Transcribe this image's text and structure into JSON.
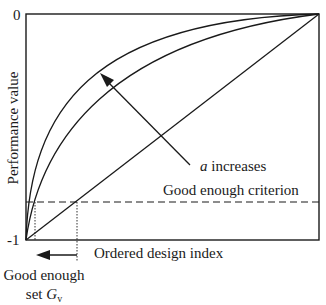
{
  "figure": {
    "y_axis": {
      "label": "Performance value",
      "tick_top": "0",
      "tick_bottom": "-1"
    },
    "x_axis": {
      "label": "Ordered design index"
    },
    "criterion_label": "Good enough criterion",
    "annotation": {
      "variable": "a",
      "text": " increases"
    },
    "set_label": {
      "line1": "Good enough",
      "line2_prefix": "set ",
      "line2_symbol": "G",
      "line2_subscript": "v"
    },
    "colors": {
      "stroke": "#1a1a1a",
      "background": "#ffffff"
    }
  }
}
